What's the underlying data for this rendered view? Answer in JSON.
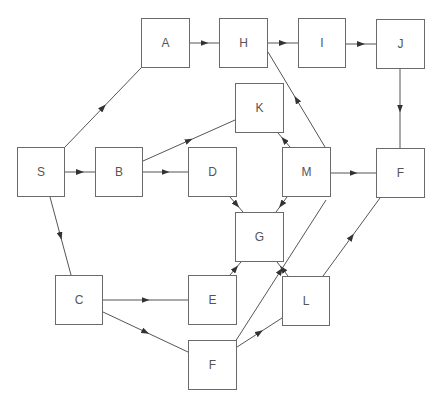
{
  "diagram": {
    "type": "directed-network",
    "nodes": [
      {
        "id": "S",
        "label": "S",
        "x": 17,
        "y": 147,
        "w": 48,
        "h": 50
      },
      {
        "id": "A",
        "label": "A",
        "x": 141,
        "y": 18,
        "w": 49,
        "h": 50
      },
      {
        "id": "B",
        "label": "B",
        "x": 95,
        "y": 147,
        "w": 48,
        "h": 50
      },
      {
        "id": "C",
        "label": "C",
        "x": 55,
        "y": 275,
        "w": 48,
        "h": 50
      },
      {
        "id": "H",
        "label": "H",
        "x": 219,
        "y": 18,
        "w": 49,
        "h": 50
      },
      {
        "id": "I",
        "label": "I",
        "x": 298,
        "y": 18,
        "w": 48,
        "h": 50
      },
      {
        "id": "J",
        "label": "J",
        "x": 376,
        "y": 19,
        "w": 49,
        "h": 50
      },
      {
        "id": "K",
        "label": "K",
        "x": 235,
        "y": 83,
        "w": 49,
        "h": 50
      },
      {
        "id": "D",
        "label": "D",
        "x": 188,
        "y": 147,
        "w": 49,
        "h": 50
      },
      {
        "id": "M",
        "label": "M",
        "x": 282,
        "y": 147,
        "w": 49,
        "h": 50
      },
      {
        "id": "F1",
        "label": "F",
        "x": 376,
        "y": 148,
        "w": 49,
        "h": 50
      },
      {
        "id": "G",
        "label": "G",
        "x": 235,
        "y": 212,
        "w": 49,
        "h": 50
      },
      {
        "id": "E",
        "label": "E",
        "x": 188,
        "y": 275,
        "w": 49,
        "h": 50
      },
      {
        "id": "L",
        "label": "L",
        "x": 282,
        "y": 276,
        "w": 48,
        "h": 50
      },
      {
        "id": "F2",
        "label": "F",
        "x": 188,
        "y": 340,
        "w": 49,
        "h": 50
      }
    ],
    "edges": [
      {
        "from": "S",
        "to": "A",
        "x1": 65,
        "y1": 147,
        "x2": 141,
        "y2": 68
      },
      {
        "from": "S",
        "to": "B",
        "x1": 65,
        "y1": 172,
        "x2": 95,
        "y2": 172
      },
      {
        "from": "S",
        "to": "C",
        "x1": 50,
        "y1": 197,
        "x2": 71,
        "y2": 275
      },
      {
        "from": "A",
        "to": "H",
        "x1": 190,
        "y1": 43,
        "x2": 219,
        "y2": 43
      },
      {
        "from": "H",
        "to": "I",
        "x1": 268,
        "y1": 43,
        "x2": 298,
        "y2": 43
      },
      {
        "from": "I",
        "to": "J",
        "x1": 346,
        "y1": 44,
        "x2": 376,
        "y2": 44
      },
      {
        "from": "J",
        "to": "F1",
        "x1": 400,
        "y1": 69,
        "x2": 400,
        "y2": 148
      },
      {
        "from": "B",
        "to": "K",
        "x1": 143,
        "y1": 161,
        "x2": 235,
        "y2": 120
      },
      {
        "from": "B",
        "to": "D",
        "x1": 143,
        "y1": 172,
        "x2": 188,
        "y2": 172
      },
      {
        "from": "M",
        "to": "H",
        "x1": 325,
        "y1": 147,
        "x2": 268,
        "y2": 52
      },
      {
        "from": "M",
        "to": "K",
        "x1": 290,
        "y1": 147,
        "x2": 278,
        "y2": 133
      },
      {
        "from": "M",
        "to": "F1",
        "x1": 331,
        "y1": 173,
        "x2": 376,
        "y2": 173
      },
      {
        "from": "D",
        "to": "G",
        "x1": 230,
        "y1": 197,
        "x2": 243,
        "y2": 212
      },
      {
        "from": "M",
        "to": "G",
        "x1": 287,
        "y1": 197,
        "x2": 276,
        "y2": 212
      },
      {
        "from": "E",
        "to": "G",
        "x1": 230,
        "y1": 275,
        "x2": 241,
        "y2": 262
      },
      {
        "from": "L",
        "to": "G",
        "x1": 288,
        "y1": 276,
        "x2": 277,
        "y2": 262
      },
      {
        "from": "C",
        "to": "E",
        "x1": 103,
        "y1": 300,
        "x2": 188,
        "y2": 300
      },
      {
        "from": "C",
        "to": "F2",
        "x1": 103,
        "y1": 312,
        "x2": 188,
        "y2": 352
      },
      {
        "from": "F2",
        "to": "L",
        "x1": 237,
        "y1": 347,
        "x2": 282,
        "y2": 318
      },
      {
        "from": "F2",
        "to": "M",
        "x1": 235,
        "y1": 342,
        "x2": 326,
        "y2": 200
      },
      {
        "from": "L",
        "to": "F1",
        "x1": 323,
        "y1": 276,
        "x2": 380,
        "y2": 198
      }
    ]
  }
}
